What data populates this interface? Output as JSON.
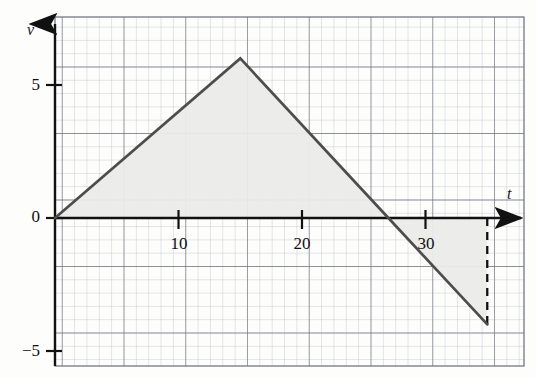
{
  "chart_data": {
    "type": "line",
    "title": "",
    "subtitle": "",
    "xlabel": "t",
    "ylabel": "v",
    "xlim": [
      -1,
      38
    ],
    "ylim": [
      -5.6,
      6.8
    ],
    "grid": true,
    "grid_minor_step_x": 1,
    "grid_minor_step_y": 0.5,
    "grid_major_step_x": 5,
    "grid_major_step_y": 2.5,
    "legend": "none",
    "x": [
      0,
      15,
      27,
      35
    ],
    "y": [
      0,
      6,
      0,
      -4
    ],
    "series": [
      {
        "name": "velocity",
        "points": [
          {
            "t": 0,
            "v": 0
          },
          {
            "t": 15,
            "v": 6
          },
          {
            "t": 27,
            "v": 0
          },
          {
            "t": 35,
            "v": -4
          }
        ]
      }
    ],
    "xticks": [
      10,
      20,
      30
    ],
    "xtick_labels": [
      "10",
      "20",
      "30"
    ],
    "yticks": [
      5,
      0,
      -5
    ],
    "ytick_labels": [
      "5",
      "0",
      "−5"
    ],
    "annotations": [
      {
        "name": "dashed-drop-line",
        "t": 35,
        "from_v": 0,
        "to_v": -4,
        "style": "dashed"
      }
    ],
    "shaded_regions": [
      {
        "name": "positive-area",
        "t_from": 0,
        "t_to": 27,
        "above_axis": true
      },
      {
        "name": "negative-area",
        "t_from": 27,
        "t_to": 35,
        "above_axis": false
      }
    ],
    "colors": {
      "curve": "#4d4d4d",
      "axis": "#111111",
      "grid_minor": "#b9bcc4",
      "grid_major": "#6f7480",
      "shade": "#ebebe9",
      "background": "#fdfdfc",
      "text": "#111111"
    }
  },
  "axes": {
    "y_axis_label": "v",
    "x_axis_label": "t"
  },
  "y_tick_labels": {
    "top": "5",
    "zero": "0",
    "bottom": "−5"
  },
  "x_tick_labels": {
    "ten": "10",
    "twenty": "20",
    "thirty": "30"
  }
}
